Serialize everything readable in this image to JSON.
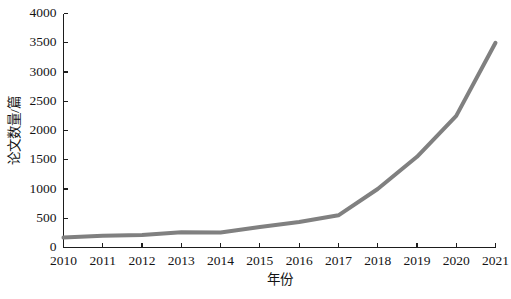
{
  "chart_data": {
    "type": "line",
    "title": "",
    "xlabel": "年份",
    "ylabel": "论文数量/篇",
    "categories": [
      "2010",
      "2011",
      "2012",
      "2013",
      "2014",
      "2015",
      "2016",
      "2017",
      "2018",
      "2019",
      "2020",
      "2021"
    ],
    "x": [
      2010,
      2011,
      2012,
      2013,
      2014,
      2015,
      2016,
      2017,
      2018,
      2019,
      2020,
      2021
    ],
    "values": [
      170,
      200,
      215,
      260,
      255,
      350,
      435,
      550,
      1000,
      1550,
      2250,
      3500
    ],
    "series": [
      {
        "name": "论文数量",
        "values": [
          170,
          200,
          215,
          260,
          255,
          350,
          435,
          550,
          1000,
          1550,
          2250,
          3500
        ]
      }
    ],
    "ylim": [
      0,
      4000
    ],
    "xlim": [
      2010,
      2021
    ],
    "ytick_labels": [
      "0",
      "500",
      "1000",
      "1500",
      "2000",
      "2500",
      "3000",
      "3500",
      "4000"
    ],
    "ytick_values": [
      0,
      500,
      1000,
      1500,
      2000,
      2500,
      3000,
      3500,
      4000
    ],
    "xtick_labels": [
      "2010",
      "2011",
      "2012",
      "2013",
      "2014",
      "2015",
      "2016",
      "2017",
      "2018",
      "2019",
      "2020",
      "2021"
    ],
    "grid": false,
    "legend": false,
    "legend_position": "none",
    "line_color": "#808080",
    "line_width": 4,
    "markers": false,
    "axis_color": "#1d1d1d",
    "background_color": "#ffffff"
  }
}
